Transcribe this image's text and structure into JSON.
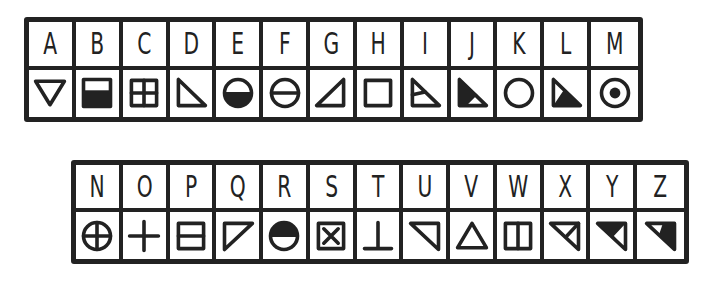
{
  "cipher": {
    "rows": [
      {
        "name": "top",
        "cells": [
          {
            "letter": "A",
            "symbol": "triangle-down-outline"
          },
          {
            "letter": "B",
            "symbol": "square-bottom-filled"
          },
          {
            "letter": "C",
            "symbol": "square-grid-four"
          },
          {
            "letter": "D",
            "symbol": "right-triangle-outline"
          },
          {
            "letter": "E",
            "symbol": "circle-bottom-filled"
          },
          {
            "letter": "F",
            "symbol": "circle-horizontal-bar"
          },
          {
            "letter": "G",
            "symbol": "right-triangle-mirrored-outline"
          },
          {
            "letter": "H",
            "symbol": "square-outline"
          },
          {
            "letter": "I",
            "symbol": "right-triangle-split"
          },
          {
            "letter": "J",
            "symbol": "right-triangle-filled-top"
          },
          {
            "letter": "K",
            "symbol": "circle-outline"
          },
          {
            "letter": "L",
            "symbol": "right-triangle-filled-bottom"
          },
          {
            "letter": "M",
            "symbol": "circle-dot"
          }
        ]
      },
      {
        "name": "bottom",
        "cells": [
          {
            "letter": "N",
            "symbol": "circle-cross"
          },
          {
            "letter": "O",
            "symbol": "plus"
          },
          {
            "letter": "P",
            "symbol": "square-horizontal-bar"
          },
          {
            "letter": "Q",
            "symbol": "triangle-top-left-outline"
          },
          {
            "letter": "R",
            "symbol": "circle-top-filled"
          },
          {
            "letter": "S",
            "symbol": "square-x"
          },
          {
            "letter": "T",
            "symbol": "up-tack"
          },
          {
            "letter": "U",
            "symbol": "triangle-top-right-outline"
          },
          {
            "letter": "V",
            "symbol": "triangle-up-outline"
          },
          {
            "letter": "W",
            "symbol": "square-vertical-bar"
          },
          {
            "letter": "X",
            "symbol": "triangle-top-right-split"
          },
          {
            "letter": "Y",
            "symbol": "triangle-top-right-filled-left"
          },
          {
            "letter": "Z",
            "symbol": "triangle-top-right-filled-right"
          }
        ]
      }
    ],
    "ink_color": "#222222"
  }
}
